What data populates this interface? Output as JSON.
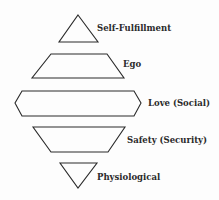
{
  "diagram": {
    "type": "needs-hierarchy",
    "stroke_color": "#2a2a2a",
    "levels": [
      {
        "label": "Self-Fulfillment",
        "shape": "triangle-up"
      },
      {
        "label": "Ego",
        "shape": "trapezoid-up"
      },
      {
        "label": "Love (Social)",
        "shape": "hexagon"
      },
      {
        "label": "Safety (Security)",
        "shape": "trapezoid-down"
      },
      {
        "label": "Physiological",
        "shape": "triangle-down"
      }
    ]
  }
}
